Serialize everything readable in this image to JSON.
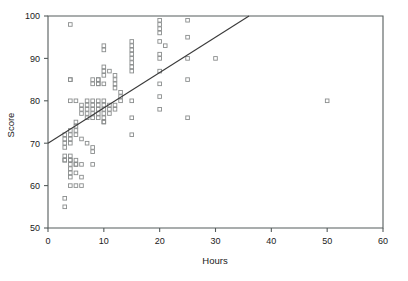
{
  "chart_data": {
    "type": "scatter",
    "title": "",
    "xlabel": "Hours",
    "ylabel": "Score",
    "xlim": [
      0,
      60
    ],
    "ylim": [
      50,
      100
    ],
    "xticks": [
      0,
      10,
      20,
      30,
      40,
      50,
      60
    ],
    "yticks": [
      50,
      60,
      70,
      80,
      90,
      100
    ],
    "grid": false,
    "legend": null,
    "marker": "open-square",
    "marker_color": "#8a8d8d",
    "line_color": "#3a3a3a",
    "axis_color": "#555c5c",
    "series": [
      {
        "name": "observations",
        "x": [
          4,
          3,
          3,
          3,
          3,
          4,
          4,
          4,
          4,
          4,
          4,
          5,
          5,
          5,
          5,
          5,
          6,
          6,
          6,
          3,
          4,
          5,
          6,
          7,
          7,
          7,
          7,
          7,
          8,
          8,
          8,
          8,
          8,
          8,
          8,
          9,
          9,
          9,
          9,
          9,
          9,
          9,
          10,
          10,
          10,
          10,
          10,
          10,
          10,
          11,
          11,
          11,
          12,
          12,
          6,
          7,
          8,
          8,
          9,
          9,
          10,
          10,
          11,
          5,
          6,
          8,
          10,
          3,
          3,
          4,
          4,
          4,
          4,
          5,
          5,
          4,
          4,
          5,
          6,
          3,
          3,
          4,
          15,
          15,
          15,
          15,
          15,
          15,
          15,
          15,
          15,
          15,
          15,
          20,
          20,
          20,
          20,
          20,
          20,
          20,
          20,
          20,
          20,
          25,
          25,
          25,
          25,
          25,
          30,
          50,
          4,
          10,
          10,
          10,
          12,
          12,
          12,
          12,
          13,
          13,
          13,
          20,
          21
        ],
        "y": [
          98,
          72,
          71,
          70,
          69,
          85,
          80,
          73,
          72,
          71,
          70,
          80,
          75,
          74,
          73,
          72,
          79,
          78,
          77,
          66,
          66,
          65,
          65,
          80,
          79,
          78,
          77,
          76,
          85,
          84,
          80,
          79,
          78,
          77,
          76,
          85,
          84,
          80,
          79,
          78,
          77,
          76,
          84,
          80,
          79,
          78,
          77,
          76,
          75,
          79,
          78,
          77,
          79,
          78,
          71,
          70,
          69,
          68,
          85,
          84,
          93,
          92,
          87,
          60,
          60,
          65,
          75,
          67,
          66,
          67,
          66,
          65,
          64,
          66,
          65,
          63,
          62,
          63,
          62,
          57,
          55,
          60,
          94,
          93,
          92,
          91,
          90,
          89,
          88,
          87,
          80,
          76,
          72,
          99,
          98,
          97,
          96,
          91,
          90,
          87,
          84,
          81,
          78,
          99,
          95,
          90,
          85,
          76,
          90,
          80,
          85,
          87,
          86,
          88,
          86,
          85,
          84,
          83,
          82,
          81,
          80,
          94,
          93
        ]
      }
    ],
    "trendline": {
      "name": "regression-line",
      "x_start": 0,
      "y_start": 70,
      "x_end": 36,
      "y_end": 100
    }
  }
}
